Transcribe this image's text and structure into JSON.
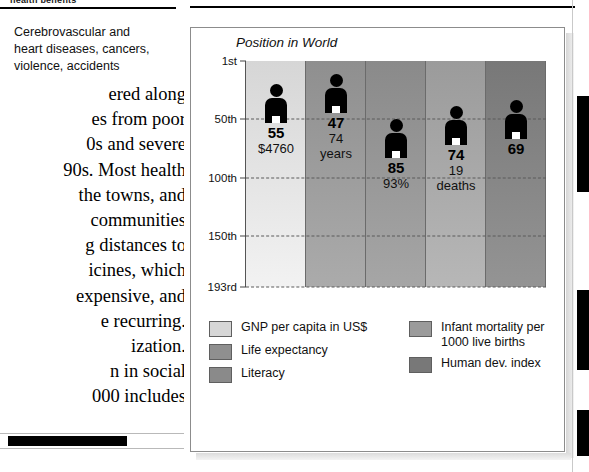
{
  "article": {
    "header_text": "health benefits",
    "caption_lines": [
      "Cerebrovascular and",
      "heart diseases, cancers,",
      "violence, accidents"
    ],
    "body_lines": [
      "ered along",
      "es from poor",
      "0s and severe",
      "90s. Most health",
      "the towns, and",
      "communities",
      "g distances to",
      "icines, which",
      "expensive, and",
      "e recurring.",
      "ization.",
      "n in social",
      "000 includes"
    ]
  },
  "chart_data": {
    "type": "bar",
    "title": "Position in World",
    "xlabel": "",
    "ylabel": "Position in World",
    "ylim": [
      "1st",
      "193rd"
    ],
    "grid": true,
    "legend_position": "bottom",
    "y_ticks": [
      "1st",
      "50th",
      "100th",
      "150th",
      "193rd"
    ],
    "y_tick_values": [
      1,
      50,
      100,
      150,
      193
    ],
    "categories": [
      "GNP per capita in US$",
      "Life expectancy",
      "Literacy",
      "Infant mortality per 1000 live births",
      "Human dev. index"
    ],
    "values": [
      55,
      47,
      85,
      74,
      69
    ],
    "annotations": [
      "$4760",
      "74 years",
      "93%",
      "19 deaths",
      ""
    ],
    "series": [
      {
        "name": "Position in World",
        "values": [
          55,
          47,
          85,
          74,
          69
        ]
      }
    ],
    "bars": [
      {
        "category": "GNP per capita in US$",
        "rank": 55,
        "rank_label": "55",
        "detail": "$4760",
        "detail2": "",
        "color": "#d6d6d6"
      },
      {
        "category": "Life expectancy",
        "rank": 47,
        "rank_label": "47",
        "detail": "74",
        "detail2": "years",
        "color": "#8f8f8f"
      },
      {
        "category": "Literacy",
        "rank": 85,
        "rank_label": "85",
        "detail": "93%",
        "detail2": "",
        "color": "#8a8a8a"
      },
      {
        "category": "Infant mortality per 1000 live births",
        "rank": 74,
        "rank_label": "74",
        "detail": "19",
        "detail2": "deaths",
        "color": "#9b9b9b"
      },
      {
        "category": "Human dev. index",
        "rank": 69,
        "rank_label": "69",
        "detail": "",
        "detail2": "",
        "color": "#787878"
      }
    ]
  },
  "legend": {
    "left_items": [
      {
        "label": "GNP per capita in US$",
        "color": "#d6d6d6"
      },
      {
        "label": "Life expectancy",
        "color": "#8f8f8f"
      },
      {
        "label": "Literacy",
        "color": "#8a8a8a"
      }
    ],
    "right_items": [
      {
        "label": "Infant mortality per 1000 live births",
        "color": "#9b9b9b"
      },
      {
        "label": "Human dev. index",
        "color": "#787878"
      }
    ]
  },
  "colors": {
    "panel_border": "#8c8c8c",
    "grid": "#5a5a5a",
    "text": "#111111",
    "figure": "#000000"
  }
}
